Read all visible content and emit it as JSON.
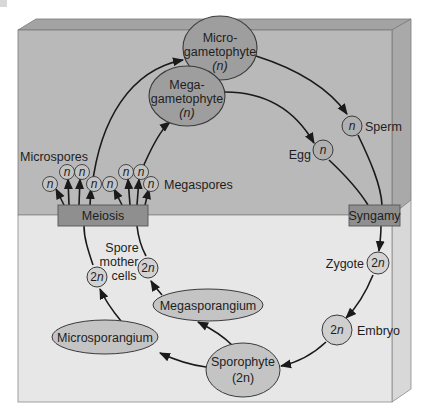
{
  "diagram": {
    "colors": {
      "upper_panel": "#b9b9b9",
      "lower_panel": "#e6e6e6",
      "side_face_upper": "#a8a8a8",
      "side_face_lower": "#d6d6d6",
      "top_face": "#a3a3a3",
      "node_fill": "#9e9e9e",
      "small_node_fill": "#c4c4c4",
      "lower_node_fill": "#c8c8c8",
      "process_box": "#8f8f8f",
      "stroke": "#3a3a3a"
    },
    "nodes": {
      "microgametophyte": {
        "line1": "Micro-",
        "line2": "gametophyte",
        "ploidy": "(n)"
      },
      "megagametophyte": {
        "line1": "Mega-",
        "line2": "gametophyte",
        "ploidy": "(n)"
      },
      "sperm": {
        "ploidy": "n",
        "label": "Sperm"
      },
      "egg": {
        "ploidy": "n",
        "label": "Egg"
      },
      "syngamy": {
        "label": "Syngamy"
      },
      "meiosis": {
        "label": "Meiosis"
      },
      "zygote": {
        "ploidy": "2n",
        "label": "Zygote"
      },
      "embryo": {
        "ploidy": "2n",
        "label": "Embryo"
      },
      "sporophyte": {
        "line1": "Sporophyte",
        "ploidy": "(2n)"
      },
      "megasporangium": {
        "label": "Megasporangium"
      },
      "microsporangium": {
        "label": "Microsporangium"
      },
      "spore_mother_cells": {
        "line1": "Spore",
        "line2": "mother",
        "line3": "cells",
        "ploidy": "2n"
      },
      "microspores": {
        "label": "Microspores",
        "ploidy": "n",
        "count": 4
      },
      "megaspores": {
        "label": "Megaspores",
        "ploidy": "n",
        "count": 4
      }
    },
    "regions": {
      "upper": "Haploid (n) generation",
      "lower": "Diploid (2n) generation"
    }
  }
}
